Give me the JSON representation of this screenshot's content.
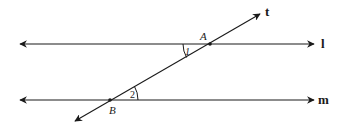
{
  "diagram": {
    "lines": [
      {
        "id": "l",
        "label": "l",
        "y": 44,
        "x1": 18,
        "x2": 316
      },
      {
        "id": "m",
        "label": "m",
        "y": 100,
        "x1": 18,
        "x2": 316
      }
    ],
    "transversal": {
      "id": "t",
      "label": "t",
      "x1": 73,
      "y1": 122,
      "x2": 262,
      "y2": 13
    },
    "points": [
      {
        "id": "A",
        "label": "A",
        "x": 210,
        "y": 44
      },
      {
        "id": "B",
        "label": "B",
        "x": 110,
        "y": 100
      }
    ],
    "angles": [
      {
        "id": "1",
        "label": "1",
        "vertex": "A",
        "between": [
          "line l (left)",
          "transversal (down)"
        ]
      },
      {
        "id": "2",
        "label": "2",
        "vertex": "B",
        "between": [
          "line m (right)",
          "transversal (up)"
        ]
      }
    ],
    "colors": {
      "stroke": "#1a1a1a",
      "background": "#ffffff"
    }
  }
}
